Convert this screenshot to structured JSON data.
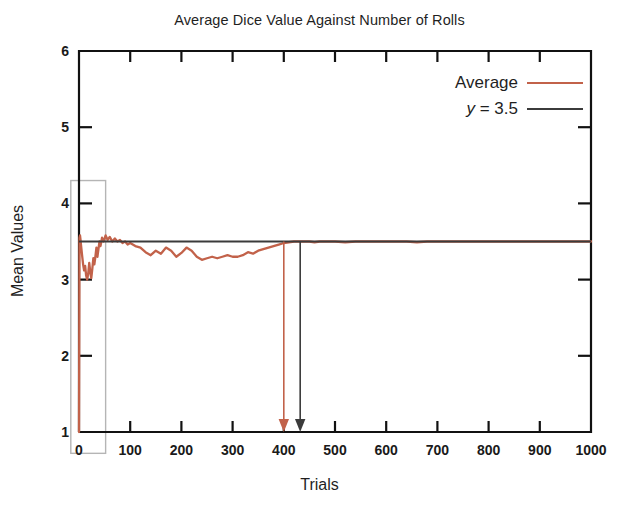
{
  "chart_data": {
    "type": "line",
    "title": "Average Dice Value Against Number of Rolls",
    "xlabel": "Trials",
    "ylabel": "Mean Values",
    "xlim": [
      0,
      1000
    ],
    "ylim": [
      1,
      6
    ],
    "xticks": [
      0,
      100,
      200,
      300,
      400,
      500,
      600,
      700,
      800,
      900,
      1000
    ],
    "xtick_labels": [
      "0",
      "100",
      "200",
      "300",
      "400",
      "500",
      "600",
      "700",
      "800",
      "900",
      "1000"
    ],
    "yticks": [
      1,
      2,
      3,
      4,
      5,
      6
    ],
    "ytick_labels": [
      "1",
      "2",
      "3",
      "4",
      "5",
      "6"
    ],
    "grid": false,
    "legend_position": "top-right",
    "series": [
      {
        "name": "Average",
        "color": "#c2624a",
        "x": [
          0,
          1,
          2,
          3,
          4,
          6,
          8,
          10,
          12,
          14,
          16,
          18,
          20,
          22,
          24,
          26,
          28,
          30,
          32,
          34,
          36,
          38,
          40,
          42,
          45,
          48,
          52,
          56,
          60,
          65,
          70,
          75,
          80,
          85,
          90,
          95,
          100,
          110,
          120,
          130,
          140,
          150,
          160,
          170,
          180,
          190,
          200,
          210,
          220,
          230,
          240,
          250,
          260,
          270,
          280,
          290,
          300,
          310,
          320,
          330,
          340,
          350,
          360,
          370,
          380,
          390,
          400,
          410,
          420,
          430,
          440,
          450,
          460,
          470,
          480,
          500,
          520,
          540,
          560,
          580,
          600,
          620,
          640,
          660,
          680,
          700,
          720,
          740,
          760,
          780,
          800,
          820,
          840,
          860,
          880,
          900,
          920,
          940,
          960,
          980,
          1000
        ],
        "y": [
          1.0,
          3.55,
          3.58,
          3.52,
          3.45,
          3.32,
          3.2,
          3.12,
          3.18,
          3.05,
          3.0,
          3.08,
          3.22,
          3.1,
          3.02,
          3.14,
          3.28,
          3.2,
          3.3,
          3.42,
          3.3,
          3.4,
          3.5,
          3.44,
          3.55,
          3.5,
          3.58,
          3.52,
          3.56,
          3.5,
          3.54,
          3.5,
          3.52,
          3.48,
          3.5,
          3.46,
          3.48,
          3.44,
          3.42,
          3.36,
          3.32,
          3.38,
          3.34,
          3.42,
          3.38,
          3.3,
          3.35,
          3.42,
          3.38,
          3.3,
          3.26,
          3.28,
          3.3,
          3.28,
          3.3,
          3.32,
          3.3,
          3.3,
          3.32,
          3.36,
          3.34,
          3.38,
          3.4,
          3.42,
          3.44,
          3.46,
          3.48,
          3.49,
          3.5,
          3.5,
          3.5,
          3.5,
          3.49,
          3.5,
          3.5,
          3.5,
          3.49,
          3.5,
          3.5,
          3.5,
          3.5,
          3.5,
          3.5,
          3.49,
          3.5,
          3.5,
          3.5,
          3.5,
          3.5,
          3.5,
          3.5,
          3.5,
          3.5,
          3.5,
          3.5,
          3.5,
          3.5,
          3.5,
          3.5,
          3.5,
          3.5
        ]
      },
      {
        "name": "y = 3.5",
        "color": "#3b3b3b",
        "constant": 3.5
      }
    ],
    "annotations": [
      {
        "name": "average-arrow",
        "x": 400,
        "from_y": 3.5,
        "to_y": 1.0,
        "color": "#c2624a"
      },
      {
        "name": "reference-arrow",
        "x": 432,
        "from_y": 3.5,
        "to_y": 1.0,
        "color": "#3b3b3b"
      }
    ],
    "highlight_box": {
      "name": "early-trials-highlight",
      "x_from": -16,
      "x_to": 52,
      "y_from": 0.72,
      "y_to": 4.3,
      "color": "#b5b5b5"
    }
  },
  "legend": {
    "items": [
      {
        "label": "Average",
        "color": "#c2624a"
      },
      {
        "label_prefix": "y",
        "label_rest": " = 3.5",
        "color": "#3b3b3b"
      }
    ]
  },
  "axes": {
    "x_title": "Trials",
    "y_title": "Mean Values"
  }
}
